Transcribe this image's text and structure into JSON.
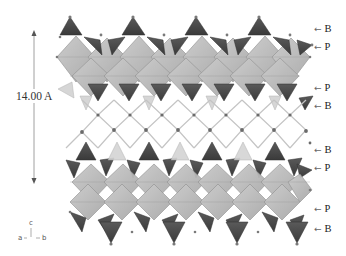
{
  "figure": {
    "type": "crystal-structure-polyhedral-view",
    "dimension": {
      "label": "14.00 A",
      "arrow_top_y": 33,
      "arrow_bottom_y": 180
    },
    "layer_labels": [
      {
        "text": "B",
        "y": 29
      },
      {
        "text": "P",
        "y": 47
      },
      {
        "text": "P",
        "y": 88
      },
      {
        "text": "B",
        "y": 106
      },
      {
        "text": "B",
        "y": 150
      },
      {
        "text": "P",
        "y": 168
      },
      {
        "text": "P",
        "y": 209
      },
      {
        "text": "B",
        "y": 229
      }
    ],
    "arrow_glyph": "←",
    "axes": {
      "c": "c",
      "a": "a",
      "b": "b"
    },
    "colors": {
      "octahedra": "#b8b8b8",
      "octahedra_edge": "#8a8a8a",
      "tetrahedra": "#4a4a4a",
      "light_tetrahedra": "#d4d4d4",
      "bonds": "#c8c8c8",
      "atoms": "#6a6a6a",
      "dimension_line": "#9a9a9a"
    }
  }
}
